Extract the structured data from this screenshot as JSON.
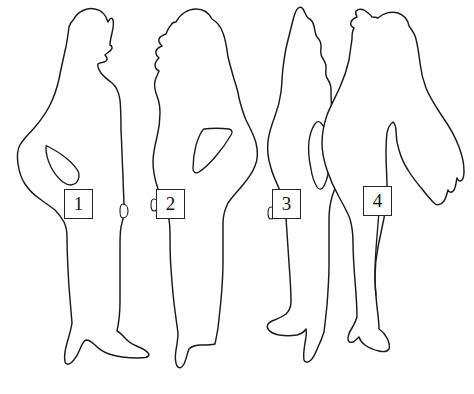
{
  "image": {
    "title": "Four human figure outlines with numbered labels",
    "width": 474,
    "height": 394,
    "background_color": "#ffffff",
    "line_color": "#1a1a1a",
    "style": "hand-traced black contour line drawing on white"
  },
  "figures": [
    {
      "id": "figure-1",
      "label": "1",
      "label_box": {
        "x": 64,
        "y": 189,
        "width": 29,
        "height": 30
      },
      "description": "standing person facing right, long hair, long dress, left hand on hip forming triangular gap",
      "facing": "right",
      "pose": "hand-on-hip"
    },
    {
      "id": "figure-2",
      "label": "2",
      "label_box": {
        "x": 156,
        "y": 189,
        "width": 29,
        "height": 30
      },
      "description": "standing person facing left, long wavy hair, long dress, arm akimbo forming triangular gap",
      "facing": "left",
      "pose": "arm-akimbo"
    },
    {
      "id": "figure-3",
      "label": "3",
      "label_box": {
        "x": 272,
        "y": 189,
        "width": 29,
        "height": 30
      },
      "description": "standing person with pointed hooded head, long robe, arm at side forming leaf-shaped gap",
      "facing": "front",
      "pose": "arm-at-side"
    },
    {
      "id": "figure-4",
      "label": "4",
      "label_box": {
        "x": 363,
        "y": 186,
        "width": 29,
        "height": 30
      },
      "description": "standing person facing left, long hair down back, separated legs, ragged arm and garment edge",
      "facing": "left",
      "pose": "standing-legs-apart"
    }
  ],
  "colors": {
    "background": "#ffffff",
    "outline": "#1a1a1a",
    "label_border": "#262626",
    "label_text": "#111111"
  }
}
